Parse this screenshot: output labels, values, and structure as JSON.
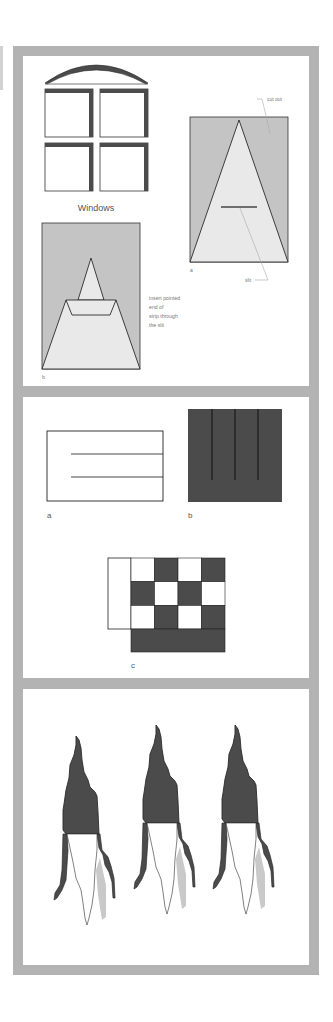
{
  "colors": {
    "frame": "#b3b3b3",
    "panel_bg": "#ffffff",
    "cutout_gray": "#c4c4c4",
    "strip_light": "#e9e9e9",
    "dark_fill": "#4b4b4b",
    "outline": "#2b2b2b",
    "shadow": "#c9c9c9",
    "leader": "#aaaaaa"
  },
  "panel_1": {
    "windows": {
      "label": "Windows",
      "panes": 4
    },
    "figure_a": {
      "label": "a",
      "callouts": {
        "cut_out": "cut out",
        "slit": "slit"
      }
    },
    "figure_b": {
      "label": "b",
      "instruction_lines": [
        "insert pointed",
        "end of",
        "strip through",
        "the slit"
      ]
    }
  },
  "panel_2": {
    "figure_a": {
      "label": "a",
      "slits": 2
    },
    "figure_b": {
      "label": "b",
      "slits": 3
    },
    "figure_c": {
      "label": "c",
      "grid": [
        [
          "W",
          "D",
          "W",
          "D"
        ],
        [
          "D",
          "W",
          "D",
          "W"
        ],
        [
          "W",
          "D",
          "W",
          "D"
        ]
      ]
    }
  },
  "panel_3": {
    "torches": 3
  }
}
